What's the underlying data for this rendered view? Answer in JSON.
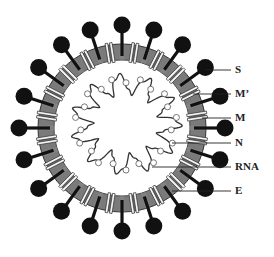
{
  "diagram": {
    "center": [
      122,
      128
    ],
    "envelope": {
      "outer_radius": 84,
      "inner_radius": 68,
      "color": "#6e6e6e"
    },
    "spike_count": 20,
    "spike_ball_distance": 103,
    "spike_ball_radius": 8.5,
    "colors": {
      "spike": "#111111",
      "membrane_protein": "#f2f2f2",
      "rna": "#333333",
      "line": "#222222"
    },
    "labels": [
      {
        "id": "S",
        "text": "S",
        "y": 70,
        "target": [
          205,
          70
        ]
      },
      {
        "id": "M-prime",
        "text": "M’",
        "y": 94,
        "target": [
          193,
          94
        ]
      },
      {
        "id": "M",
        "text": "M",
        "y": 118,
        "target": [
          202,
          118
        ]
      },
      {
        "id": "N",
        "text": "N",
        "y": 143,
        "target": [
          172,
          143
        ]
      },
      {
        "id": "RNA",
        "text": "RNA",
        "y": 167,
        "target": [
          152,
          167
        ]
      },
      {
        "id": "E",
        "text": "E",
        "y": 191,
        "target": [
          172,
          191
        ]
      }
    ]
  }
}
